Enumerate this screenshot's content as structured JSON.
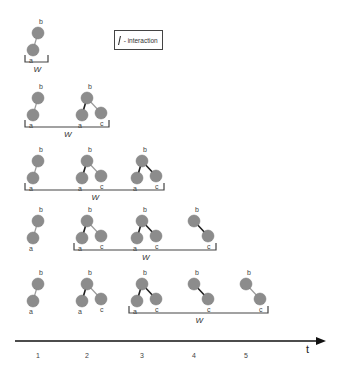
{
  "legend": {
    "text": "- interaction",
    "icon": "interaction-edge-icon"
  },
  "colors": {
    "node": "#8c8c8c",
    "node_stroke": "#7a7a7a",
    "interaction_edge": "#1e1e1e",
    "plain_edge": "#9a9a9a",
    "bracket": "#444444",
    "axis": "#111111"
  },
  "axis": {
    "label": "t",
    "ticks": [
      "1",
      "2",
      "3",
      "4",
      "5"
    ]
  },
  "window_label": "W",
  "rows": [
    {
      "window_from": 1,
      "window_to": 1
    },
    {
      "window_from": 1,
      "window_to": 2
    },
    {
      "window_from": 1,
      "window_to": 3
    },
    {
      "window_from": 2,
      "window_to": 4
    },
    {
      "window_from": 3,
      "window_to": 5
    }
  ],
  "snapshots": [
    {
      "t": 1,
      "nodes": [
        "a",
        "b"
      ],
      "edges": [
        {
          "from": "b",
          "to": "a",
          "interaction": false
        }
      ]
    },
    {
      "t": 2,
      "nodes": [
        "a",
        "b",
        "c"
      ],
      "edges": [
        {
          "from": "b",
          "to": "a",
          "interaction": true
        },
        {
          "from": "b",
          "to": "c",
          "interaction": false
        }
      ]
    },
    {
      "t": 3,
      "nodes": [
        "a",
        "b",
        "c"
      ],
      "edges": [
        {
          "from": "b",
          "to": "a",
          "interaction": true
        },
        {
          "from": "b",
          "to": "c",
          "interaction": true
        }
      ]
    },
    {
      "t": 4,
      "nodes": [
        "b",
        "c"
      ],
      "edges": [
        {
          "from": "b",
          "to": "c",
          "interaction": true
        }
      ]
    },
    {
      "t": 5,
      "nodes": [
        "b",
        "c"
      ],
      "edges": [
        {
          "from": "b",
          "to": "c",
          "interaction": false
        }
      ]
    }
  ]
}
